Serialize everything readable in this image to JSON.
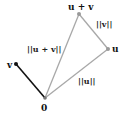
{
  "diagram": {
    "title": "",
    "points": {
      "origin": {
        "label": "0",
        "x": 45,
        "y": 98
      },
      "v": {
        "label": "v",
        "x": 16,
        "y": 64
      },
      "u": {
        "label": "u",
        "x": 108,
        "y": 49
      },
      "u_plus_v": {
        "label": "u + v",
        "x": 79,
        "y": 14
      }
    },
    "edges": [
      {
        "from": "origin",
        "to": "v",
        "color": "#111111",
        "label": ""
      },
      {
        "from": "origin",
        "to": "u",
        "color": "#a8a8a8",
        "label": "||u||"
      },
      {
        "from": "u",
        "to": "u_plus_v",
        "color": "#a8a8a8",
        "label": "||v||"
      },
      {
        "from": "origin",
        "to": "u_plus_v",
        "color": "#a8a8a8",
        "label": "||u + v||"
      }
    ],
    "labels": {
      "origin": "0",
      "v": "v",
      "u": "u",
      "u_plus_v": "u + v",
      "norm_u": "||u||",
      "norm_v": "||v||",
      "norm_u_plus_v": "||u + v||"
    }
  }
}
